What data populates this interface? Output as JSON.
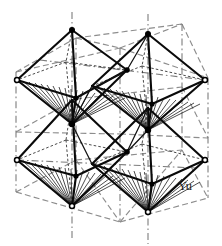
{
  "figure": {
    "kind": "crystal-structure-diagram",
    "title": "",
    "corner_label": "Yu",
    "colors": {
      "background": "#ffffff",
      "octahedron_edge": "#0a0a0a",
      "unit_cell_frame": "#8d8d8d",
      "unit_cell_axis": "#7d7d7d",
      "hatch_fan": "#050505",
      "label_text": "#1b1b1b",
      "node_fill": "#ffffff"
    },
    "counts": {
      "octahedra": "4",
      "unit_cell_edges": "12",
      "shared_corner_nodes": "4"
    }
  },
  "unit_cell": {
    "name": "cubic-unit-cell",
    "front_face": [
      [
        16,
        72
      ],
      [
        120,
        48
      ],
      [
        208,
        78
      ],
      [
        208,
        198
      ],
      [
        120,
        222
      ],
      [
        16,
        192
      ]
    ],
    "top_face": [
      [
        16,
        72
      ],
      [
        76,
        38
      ],
      [
        182,
        24
      ],
      [
        120,
        48
      ]
    ],
    "right_face": [
      [
        120,
        48
      ],
      [
        182,
        24
      ],
      [
        208,
        78
      ]
    ],
    "hidden_vertex": [
      76,
      38
    ],
    "vertical_edges": [
      {
        "from": [
          16,
          72
        ],
        "to": [
          16,
          192
        ]
      },
      {
        "from": [
          120,
          48
        ],
        "to": [
          120,
          222
        ]
      },
      {
        "from": [
          208,
          78
        ],
        "to": [
          208,
          198
        ]
      },
      {
        "from": [
          76,
          38
        ],
        "to": [
          76,
          160
        ]
      },
      {
        "from": [
          182,
          24
        ],
        "to": [
          182,
          150
        ]
      }
    ]
  },
  "octahedra": [
    {
      "name": "octahedron-upper-left",
      "center": [
        72,
        90
      ],
      "apex_top": [
        72,
        30
      ],
      "apex_bottom": [
        72,
        124
      ],
      "equator": [
        [
          17,
          80
        ],
        [
          66,
          62
        ],
        [
          127,
          70
        ],
        [
          76,
          98
        ]
      ],
      "hatched_faces": "lower-front"
    },
    {
      "name": "octahedron-upper-right",
      "center": [
        148,
        95
      ],
      "apex_top": [
        148,
        34
      ],
      "apex_bottom": [
        148,
        130
      ],
      "equator": [
        [
          92,
          86
        ],
        [
          142,
          66
        ],
        [
          205,
          80
        ],
        [
          152,
          104
        ]
      ],
      "hatched_faces": "lower-front"
    },
    {
      "name": "octahedron-lower-left",
      "center": [
        72,
        160
      ],
      "apex_top": [
        72,
        100
      ],
      "apex_bottom": [
        72,
        206
      ],
      "equator": [
        [
          17,
          160
        ],
        [
          66,
          140
        ],
        [
          127,
          152
        ],
        [
          76,
          176
        ]
      ],
      "hatched_faces": "lower-front"
    },
    {
      "name": "octahedron-lower-right",
      "center": [
        148,
        168
      ],
      "apex_top": [
        148,
        108
      ],
      "apex_bottom": [
        148,
        212
      ],
      "equator": [
        [
          92,
          164
        ],
        [
          142,
          144
        ],
        [
          205,
          160
        ],
        [
          152,
          184
        ]
      ],
      "hatched_faces": "lower-front"
    }
  ],
  "nodes": {
    "apex_top_left": [
      72,
      30
    ],
    "apex_top_right": [
      148,
      34
    ],
    "apex_bottom_left": [
      72,
      206
    ],
    "apex_bottom_right": [
      148,
      212
    ],
    "corner_left_upper": [
      17,
      80
    ],
    "corner_right_upper": [
      205,
      80
    ],
    "corner_left_lower": [
      17,
      160
    ],
    "corner_right_lower": [
      205,
      160
    ],
    "shared_center_upper_left": [
      72,
      124
    ],
    "shared_center_upper_right": [
      148,
      130
    ],
    "bridge_mid_upper": [
      127,
      70
    ],
    "bridge_mid_lower": [
      127,
      152
    ]
  }
}
